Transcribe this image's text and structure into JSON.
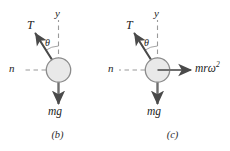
{
  "figure": {
    "kind": "free-body-diagram-pair",
    "background_color": "#ffffff",
    "ink_color": "#3a3a3a",
    "ball_fill_color": "#e9e9e9",
    "ball_stroke_color": "#8c8c8c",
    "panels": [
      {
        "id": "b",
        "caption": "(b)",
        "labels": {
          "tension": "T",
          "axis_y": "y",
          "axis_n": "n",
          "angle": "θ",
          "weight": "mg"
        },
        "vectors": [
          {
            "name": "tension",
            "label": "T",
            "direction": "up-left",
            "style": "solid-arrow"
          },
          {
            "name": "weight",
            "label": "mg",
            "direction": "down",
            "style": "solid-arrow"
          }
        ],
        "reference_lines": [
          {
            "name": "y-axis",
            "label": "y",
            "direction": "up",
            "style": "dashed"
          },
          {
            "name": "n-axis",
            "label": "n",
            "direction": "left",
            "style": "dashed"
          }
        ]
      },
      {
        "id": "c",
        "caption": "(c)",
        "labels": {
          "tension": "T",
          "axis_y": "y",
          "axis_n": "n",
          "angle": "θ",
          "weight": "mg",
          "centrifugal_base": "mrω",
          "centrifugal_exponent": "2"
        },
        "vectors": [
          {
            "name": "tension",
            "label": "T",
            "direction": "up-left",
            "style": "solid-arrow"
          },
          {
            "name": "weight",
            "label": "mg",
            "direction": "down",
            "style": "solid-arrow"
          },
          {
            "name": "centrifugal",
            "label": "mrω²",
            "direction": "right",
            "style": "solid-arrow"
          }
        ],
        "reference_lines": [
          {
            "name": "y-axis",
            "label": "y",
            "direction": "up",
            "style": "dashed"
          },
          {
            "name": "n-axis",
            "label": "n",
            "direction": "left",
            "style": "dashed"
          }
        ]
      }
    ]
  }
}
